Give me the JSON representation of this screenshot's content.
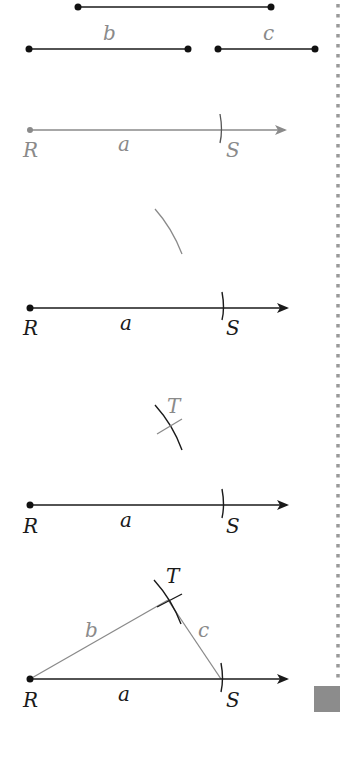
{
  "given_segments": {
    "a": {
      "label": "",
      "x1": 78,
      "x2": 271,
      "y": 7
    },
    "b": {
      "label": "b",
      "x1": 29,
      "x2": 188,
      "y": 49
    },
    "c": {
      "label": "c",
      "x1": 218,
      "x2": 315,
      "y": 49
    }
  },
  "steps": [
    {
      "step": 1,
      "points": {
        "R": "R",
        "S": "S"
      },
      "segment_label": "a",
      "description": "Mark segment a on ray from R to get S"
    },
    {
      "step": 2,
      "points": {
        "R": "R",
        "S": "S"
      },
      "segment_label": "a",
      "description": "Draw arc of radius b centered at R"
    },
    {
      "step": 3,
      "points": {
        "R": "R",
        "S": "S",
        "T": "T"
      },
      "segment_label": "a",
      "description": "Draw arc of radius c centered at S; intersection is T"
    },
    {
      "step": 4,
      "points": {
        "R": "R",
        "S": "S",
        "T": "T"
      },
      "side_labels": {
        "a": "a",
        "b": "b",
        "c": "c"
      },
      "description": "Join R-T and S-T to form triangle RST"
    }
  ],
  "colors": {
    "dark": "#1a1a1a",
    "gray": "#8a8a8a",
    "margin_marker": "#8c8c8c"
  }
}
